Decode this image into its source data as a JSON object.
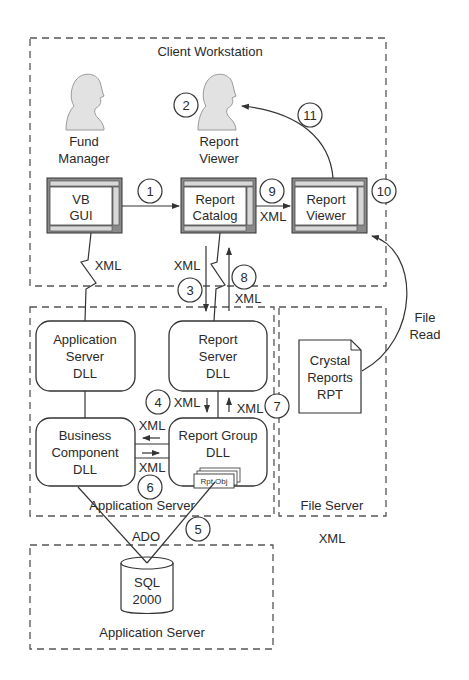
{
  "diagram": {
    "zones": {
      "client_workstation": "Client Workstation",
      "application_server_upper": "Application Server",
      "file_server": "File Server",
      "application_server_lower": "Application Server"
    },
    "actors": {
      "fund_manager": [
        "Fund",
        "Manager"
      ],
      "report_viewer": [
        "Report",
        "Viewer"
      ]
    },
    "windows": {
      "vb_gui": [
        "VB",
        "GUI"
      ],
      "report_catalog": [
        "Report",
        "Catalog"
      ],
      "report_viewer": [
        "Report",
        "Viewer"
      ]
    },
    "components": {
      "application_server_dll": [
        "Application",
        "Server",
        "DLL"
      ],
      "report_server_dll": [
        "Report",
        "Server",
        "DLL"
      ],
      "business_component_dll": [
        "Business",
        "Component",
        "DLL"
      ],
      "report_group_dll": [
        "Report Group",
        "DLL"
      ],
      "rpt_obj": "Rpt Obj",
      "crystal_reports": [
        "Crystal",
        "Reports",
        "RPT"
      ],
      "sql": [
        "SQL",
        "2000"
      ]
    },
    "steps": [
      "1",
      "2",
      "3",
      "4",
      "5",
      "6",
      "7",
      "8",
      "9",
      "10",
      "11"
    ],
    "edge_labels": {
      "xml": "XML",
      "ado": "ADO",
      "file_read": [
        "File",
        "Read"
      ],
      "stray_xml": "XML"
    }
  }
}
